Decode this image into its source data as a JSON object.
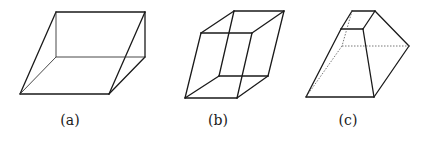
{
  "figures": [
    {
      "id": "a",
      "label": "(a)",
      "description": "oblique prism (parallelepiped slanted)",
      "vertices": {
        "top_left": [
          56,
          12
        ],
        "top_right": [
          145,
          12
        ],
        "back_left": [
          56,
          57
        ],
        "back_right": [
          145,
          57
        ],
        "bottom_left": [
          20,
          94
        ],
        "bottom_right": [
          109,
          94
        ]
      }
    },
    {
      "id": "b",
      "label": "(b)",
      "description": "parallelepiped",
      "vertices": {
        "back_top_left": [
          234,
          11
        ],
        "back_top_right": [
          284,
          11
        ],
        "front_top_left": [
          201,
          33
        ],
        "front_top_right": [
          252,
          33
        ],
        "back_bottom_left": [
          219,
          76
        ],
        "back_bottom_right": [
          268,
          76
        ],
        "front_bottom_left": [
          185,
          98
        ],
        "front_bottom_right": [
          237,
          98
        ]
      }
    },
    {
      "id": "c",
      "label": "(c)",
      "description": "frustum of a pyramid",
      "vertices": {
        "top_back_left": [
          352,
          11
        ],
        "top_back_right": [
          375,
          11
        ],
        "top_front_left": [
          341,
          29
        ],
        "top_front_right": [
          363,
          29
        ],
        "bottom_back_left": [
          342,
          46
        ],
        "bottom_back_right": [
          409,
          46
        ],
        "bottom_front_left": [
          306,
          97
        ],
        "bottom_front_right": [
          374,
          97
        ]
      }
    }
  ],
  "labels": {
    "a": "(a)",
    "b": "(b)",
    "c": "(c)"
  },
  "colors": {
    "stroke": "#1a1a1a",
    "background": "#ffffff"
  }
}
